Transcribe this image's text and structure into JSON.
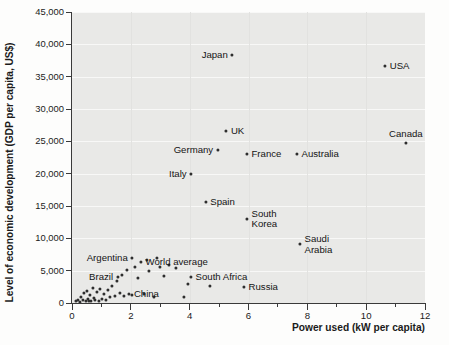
{
  "chart_data": {
    "type": "scatter",
    "title": "",
    "xlabel": "Power used (kW per capita)",
    "ylabel": "Level of economic development (GDP per capita, US$)",
    "xlim": [
      0,
      12
    ],
    "ylim": [
      0,
      45000
    ],
    "xticks": [
      0,
      2,
      4,
      6,
      8,
      10,
      12
    ],
    "xticks_minor": [
      1,
      3,
      5,
      7,
      9,
      11
    ],
    "yticks": [
      0,
      5000,
      10000,
      15000,
      20000,
      25000,
      30000,
      35000,
      40000,
      45000
    ],
    "ytick_labels": [
      "0",
      "5,000",
      "10,000",
      "15,000",
      "20,000",
      "25,000",
      "30,000",
      "35,000",
      "40,000",
      "45,000"
    ],
    "grid": "horizontal",
    "legend": "none",
    "point_color": "#2e2e2e",
    "plot_bg": "#e9e9e7",
    "labeled_points": [
      {
        "name": "Japan",
        "x": 5.45,
        "y": 38400,
        "label_pos": "left"
      },
      {
        "name": "USA",
        "x": 10.65,
        "y": 36700,
        "label_pos": "right"
      },
      {
        "name": "Canada",
        "x": 11.35,
        "y": 24700,
        "label_pos": "above"
      },
      {
        "name": "UK",
        "x": 5.25,
        "y": 26600,
        "label_pos": "right"
      },
      {
        "name": "Germany",
        "x": 4.95,
        "y": 23600,
        "label_pos": "left"
      },
      {
        "name": "France",
        "x": 5.95,
        "y": 23000,
        "label_pos": "right"
      },
      {
        "name": "Australia",
        "x": 7.65,
        "y": 23000,
        "label_pos": "right"
      },
      {
        "name": "Italy",
        "x": 4.05,
        "y": 20000,
        "label_pos": "left"
      },
      {
        "name": "Spain",
        "x": 4.55,
        "y": 15600,
        "label_pos": "right"
      },
      {
        "name": "South\nKorea",
        "x": 5.95,
        "y": 13000,
        "label_pos": "right"
      },
      {
        "name": "Saudi\nArabia",
        "x": 7.75,
        "y": 9100,
        "label_pos": "right"
      },
      {
        "name": "Argentina",
        "x": 2.05,
        "y": 6900,
        "label_pos": "left"
      },
      {
        "name": "World average",
        "x": 2.35,
        "y": 6300,
        "label_pos": "right"
      },
      {
        "name": "Brazil",
        "x": 1.55,
        "y": 4000,
        "label_pos": "left"
      },
      {
        "name": "South Africa",
        "x": 4.05,
        "y": 4100,
        "label_pos": "right"
      },
      {
        "name": "Russia",
        "x": 5.85,
        "y": 2500,
        "label_pos": "right"
      },
      {
        "name": "China",
        "x": 1.95,
        "y": 1400,
        "label_pos": "right"
      }
    ],
    "unlabeled_points": [
      {
        "x": 0.12,
        "y": 250
      },
      {
        "x": 0.2,
        "y": 400
      },
      {
        "x": 0.28,
        "y": 200
      },
      {
        "x": 0.32,
        "y": 900
      },
      {
        "x": 0.38,
        "y": 520
      },
      {
        "x": 0.42,
        "y": 1500
      },
      {
        "x": 0.46,
        "y": 300
      },
      {
        "x": 0.52,
        "y": 1850
      },
      {
        "x": 0.55,
        "y": 650
      },
      {
        "x": 0.58,
        "y": 380
      },
      {
        "x": 0.62,
        "y": 1200
      },
      {
        "x": 0.66,
        "y": 260
      },
      {
        "x": 0.7,
        "y": 2300
      },
      {
        "x": 0.74,
        "y": 780
      },
      {
        "x": 0.78,
        "y": 480
      },
      {
        "x": 0.84,
        "y": 1650
      },
      {
        "x": 0.9,
        "y": 300
      },
      {
        "x": 0.95,
        "y": 2150
      },
      {
        "x": 1.02,
        "y": 700
      },
      {
        "x": 1.08,
        "y": 1450
      },
      {
        "x": 1.15,
        "y": 420
      },
      {
        "x": 1.22,
        "y": 1950
      },
      {
        "x": 1.28,
        "y": 900
      },
      {
        "x": 1.35,
        "y": 2600
      },
      {
        "x": 1.45,
        "y": 1150
      },
      {
        "x": 1.52,
        "y": 3450
      },
      {
        "x": 1.62,
        "y": 1500
      },
      {
        "x": 1.7,
        "y": 4400
      },
      {
        "x": 1.78,
        "y": 1150
      },
      {
        "x": 1.88,
        "y": 5100
      },
      {
        "x": 2.05,
        "y": 1250
      },
      {
        "x": 2.15,
        "y": 5650
      },
      {
        "x": 2.25,
        "y": 3900
      },
      {
        "x": 2.45,
        "y": 1350
      },
      {
        "x": 2.55,
        "y": 6650
      },
      {
        "x": 2.62,
        "y": 4900
      },
      {
        "x": 2.78,
        "y": 980
      },
      {
        "x": 2.9,
        "y": 6900
      },
      {
        "x": 3.0,
        "y": 5500
      },
      {
        "x": 3.12,
        "y": 4200
      },
      {
        "x": 3.3,
        "y": 5950
      },
      {
        "x": 3.55,
        "y": 5400
      },
      {
        "x": 3.8,
        "y": 1000
      },
      {
        "x": 3.95,
        "y": 2950
      },
      {
        "x": 4.7,
        "y": 2700
      }
    ]
  }
}
